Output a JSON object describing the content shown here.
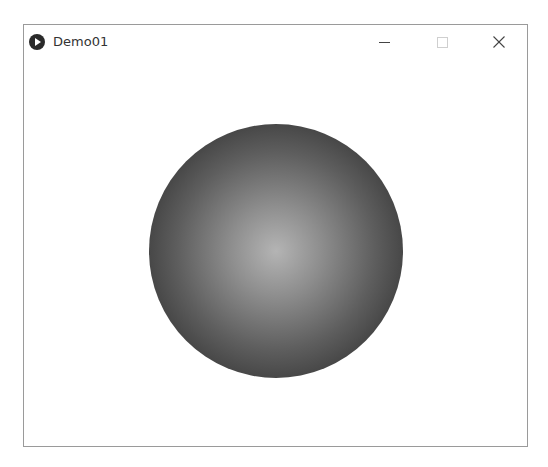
{
  "window": {
    "title": "Demo01",
    "app_icon": "play-circle-icon",
    "controls": {
      "minimize": "minimize-icon",
      "maximize": "maximize-icon",
      "maximize_enabled": false,
      "close": "close-icon"
    }
  },
  "canvas": {
    "shape": "circle",
    "fill": "radial-gradient",
    "center_color": "#b4b4b4",
    "edge_color": "#2a2a2a",
    "background": "#ffffff"
  }
}
